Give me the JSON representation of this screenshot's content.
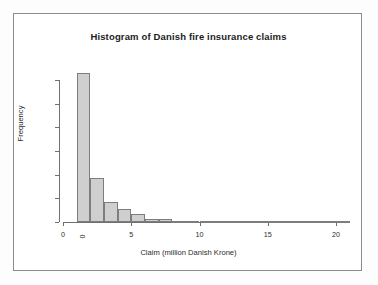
{
  "chart_data": {
    "type": "bar",
    "title": "Histogram of Danish fire insurance claims",
    "xlabel": "Claim (million Danish Krone)",
    "ylabel": "Frequency",
    "grid": false,
    "legend": null,
    "xlim": [
      0,
      21
    ],
    "ylim": [
      0,
      1300
    ],
    "xticks": [
      0,
      5,
      10,
      15,
      20
    ],
    "xtick_labels": [
      "0",
      "5",
      "10",
      "15",
      "20"
    ],
    "yticks": [
      0,
      200,
      400,
      600,
      800,
      1000,
      1200
    ],
    "ytick_labels": [
      "0",
      "200",
      "400",
      "600",
      "800",
      "1000",
      "1200"
    ],
    "bin_width": 1,
    "bin_edges": [
      1,
      2,
      3,
      4,
      5,
      6,
      7,
      8,
      9,
      10,
      11,
      12,
      13,
      14,
      15,
      16,
      17,
      18,
      19,
      20,
      21
    ],
    "bin_starts": [
      1,
      2,
      3,
      4,
      5,
      6,
      7,
      8,
      9,
      10,
      11,
      12,
      13,
      14,
      15,
      16,
      17,
      18,
      19,
      20
    ],
    "values": [
      1254,
      374,
      172,
      110,
      65,
      29,
      28,
      12,
      6,
      8,
      8,
      8,
      3,
      3,
      5,
      1,
      1,
      0,
      1,
      2
    ],
    "bar_fill_color": "#cfcfcf",
    "bar_border_color": "#7d7d7d",
    "axis_color": "#6f6f6f",
    "text_color": "#2b2b2b"
  }
}
